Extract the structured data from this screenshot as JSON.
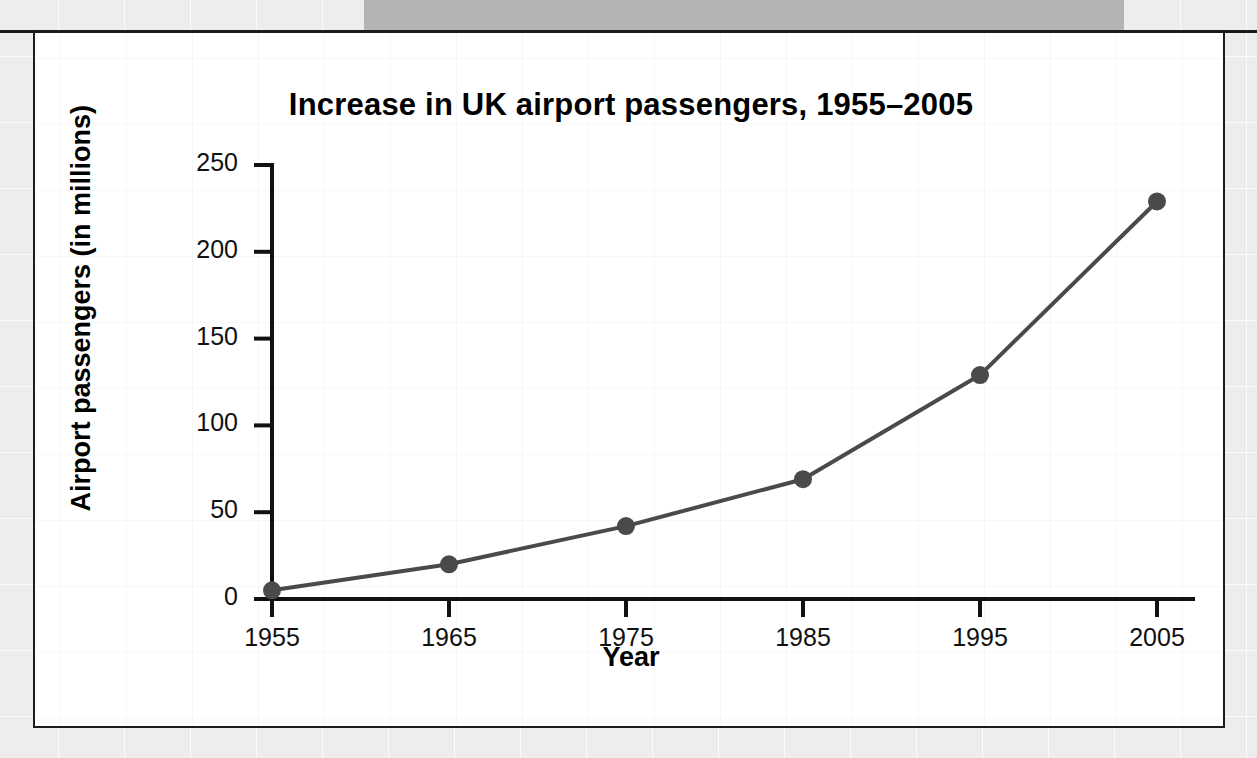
{
  "page": {
    "background_color": "#ededed",
    "band_color": "#b4b4b4"
  },
  "chart_data": {
    "type": "line",
    "title": "Increase in UK airport passengers, 1955–2005",
    "xlabel": "Year",
    "ylabel": "Airport passengers (in millions)",
    "x": [
      1955,
      1965,
      1975,
      1985,
      1995,
      2005
    ],
    "xticklabels": [
      "1955",
      "1965",
      "1975",
      "1985",
      "1995",
      "2005"
    ],
    "values": [
      5,
      20,
      42,
      69,
      129,
      229
    ],
    "series": [
      {
        "name": "UK airport passengers",
        "values": [
          5,
          20,
          42,
          69,
          129,
          229
        ]
      }
    ],
    "yticks": [
      0,
      50,
      100,
      150,
      200,
      250
    ],
    "yticklabels": [
      "0",
      "50",
      "100",
      "150",
      "200",
      "250"
    ],
    "ylim": [
      0,
      250
    ],
    "xlim": [
      1955,
      2005
    ],
    "grid": false,
    "legend": "none",
    "line_color": "#4a4a4a",
    "marker_color": "#4a4a4a",
    "marker": "circle",
    "axis_color": "#111111"
  }
}
